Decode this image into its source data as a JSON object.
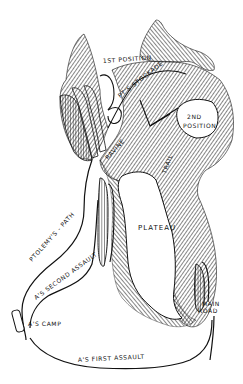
{
  "map": {
    "style": "hand-drawn black-and-white hachure sketch map",
    "colors": {
      "ink": "#111111",
      "paper": "#ffffff"
    },
    "labels": {
      "first_position": "1ST POSITION",
      "stockade": "PT'S STOCKADE",
      "second_position_1": "2ND",
      "second_position_2": "POSITION",
      "ravine": "RAVINE",
      "ravine_narrow": "TRAIL",
      "plateau": "PLATEAU",
      "ptolemys_path": "PTOLEMY'S - PATH",
      "second_assault": "A'S SECOND ASSAULT",
      "camp": "A'S CAMP",
      "first_assault": "A'S FIRST ASSAULT",
      "main_road_1": "MAIN",
      "main_road_2": "ROAD"
    }
  }
}
